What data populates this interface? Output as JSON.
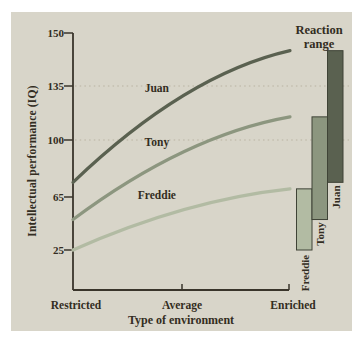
{
  "figure": {
    "y_axis_title": "Intellectual performance (IQ)",
    "x_axis_title": "Type of environment",
    "reaction_range_title_line1": "Reaction",
    "reaction_range_title_line2": "range",
    "y_tick_labels": [
      "150",
      "135",
      "100",
      "65",
      "25"
    ],
    "x_tick_labels": [
      "Restricted",
      "Average",
      "Enriched"
    ],
    "colors": {
      "panel_background": "#d8d5c9",
      "axis": "#3a352b",
      "text": "#332d22",
      "gridline": "#b9b3a2",
      "bar_outline": "#3f4336",
      "juan": "#5a6150",
      "tony": "#8c967f",
      "freddie": "#b2bba3"
    }
  },
  "chart_data": {
    "type": "line",
    "title": "",
    "xlabel": "Type of environment",
    "ylabel": "Intellectual performance (IQ)",
    "x_categories": [
      "Restricted",
      "Average",
      "Enriched"
    ],
    "y_tick_values": [
      150,
      135,
      100,
      65,
      25
    ],
    "ylim": [
      0,
      150
    ],
    "grid_levels": [
      135,
      100
    ],
    "grid_style": "faint dotted horizontal",
    "annotation": "Reaction range",
    "legend_position": "right-bars",
    "series": [
      {
        "name": "Juan",
        "color": "#5a6150",
        "iq_by_environment": {
          "Restricted": 74,
          "Average": 125,
          "Enriched": 145
        }
      },
      {
        "name": "Tony",
        "color": "#8c967f",
        "iq_by_environment": {
          "Restricted": 48,
          "Average": 93,
          "Enriched": 115
        }
      },
      {
        "name": "Freddie",
        "color": "#b2bba3",
        "iq_by_environment": {
          "Restricted": 25,
          "Average": 56,
          "Enriched": 70
        }
      }
    ],
    "reaction_range_bars": [
      {
        "name": "Freddie",
        "low_iq": 25,
        "high_iq": 70
      },
      {
        "name": "Tony",
        "low_iq": 48,
        "high_iq": 115
      },
      {
        "name": "Juan",
        "low_iq": 74,
        "high_iq": 145
      }
    ]
  }
}
